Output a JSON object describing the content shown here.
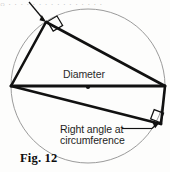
{
  "figure": {
    "caption": "Fig. 12",
    "labels": {
      "diameter": "Diameter",
      "right_angle_line1": "Right angle at",
      "right_angle_line2": "circumference"
    },
    "cropped_header_text": "○ · · · · · · · · · · · · · · · ·",
    "colors": {
      "ink": "#111111",
      "circle_stroke": "#8f8f8f",
      "paper": "#fdfdfc",
      "label_text": "#1d1d1d"
    },
    "geometry": {
      "circle": {
        "cx": 88,
        "cy": 86,
        "r": 77,
        "stroke_width": 0.9
      },
      "center_dot": {
        "cx": 88,
        "cy": 87,
        "r": 2.1
      },
      "diameter_endpoints": [
        {
          "x": 11,
          "y": 86
        },
        {
          "x": 165,
          "y": 86
        }
      ],
      "vertex_top": {
        "x": 46,
        "y": 22
      },
      "vertex_bottom_right": {
        "x": 161,
        "y": 124
      },
      "right_angle_marker_top": {
        "x": 46,
        "y": 22,
        "size": 11,
        "rotation": -31
      },
      "right_angle_marker_bottom": {
        "x": 161,
        "y": 124,
        "size": 10,
        "rotation": 21
      },
      "leader_arrow_top": {
        "x1": 30,
        "y1": 3,
        "x2": 45.5,
        "y2": 21
      },
      "leader_arrow_bottom": {
        "x1": 124,
        "y1": 128,
        "x2": 159,
        "y2": 122
      }
    }
  }
}
